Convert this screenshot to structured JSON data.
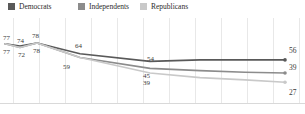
{
  "legend": {
    "items": [
      {
        "label": "Democrats",
        "color": "#595959",
        "x": 8
      },
      {
        "label": "Independents",
        "color": "#8c8c8c",
        "x": 78
      },
      {
        "label": "Republicans",
        "color": "#c9c9c9",
        "x": 140
      }
    ]
  },
  "axis": {
    "baseline_color": "#d9d9d9",
    "gridline_color": "#e8e8e8",
    "gridline_x": [
      13,
      39,
      65,
      91,
      117,
      143,
      169,
      195,
      221,
      247,
      273,
      299
    ]
  },
  "chart_data": {
    "type": "line",
    "title": "",
    "xlabel": "",
    "ylabel": "",
    "grid": true,
    "legend_position": "top-left",
    "ylim": [
      0,
      100
    ],
    "categories": [
      "1",
      "2",
      "3",
      "4",
      "5",
      "6",
      "7",
      "8"
    ],
    "series": [
      {
        "name": "Democrats",
        "color": "#595959",
        "values": [
          77,
          74,
          78,
          64,
          54,
          56,
          56,
          56
        ],
        "end_value": 56
      },
      {
        "name": "Independents",
        "color": "#8c8c8c",
        "values": [
          77,
          72,
          78,
          59,
          45,
          42,
          40,
          39
        ],
        "end_value": 39
      },
      {
        "name": "Republicans",
        "color": "#c9c9c9",
        "values": [
          77,
          72,
          78,
          59,
          39,
          33,
          30,
          27
        ],
        "end_value": 27
      }
    ],
    "point_labels": [
      {
        "text": "77",
        "x": 3,
        "y": 16,
        "series": "Democrats"
      },
      {
        "text": "74",
        "x": 17,
        "y": 19,
        "series": "Democrats"
      },
      {
        "text": "78",
        "x": 32,
        "y": 14,
        "series": "Democrats"
      },
      {
        "text": "77",
        "x": 3,
        "y": 30,
        "series": "Independents"
      },
      {
        "text": "72",
        "x": 18,
        "y": 33,
        "series": "Independents"
      },
      {
        "text": "78",
        "x": 33,
        "y": 29,
        "series": "Independents"
      },
      {
        "text": "64",
        "x": 75,
        "y": 24,
        "series": "Democrats"
      },
      {
        "text": "59",
        "x": 63,
        "y": 45,
        "series": "Independents"
      },
      {
        "text": "54",
        "x": 147,
        "y": 37,
        "series": "Democrats"
      },
      {
        "text": "45",
        "x": 143,
        "y": 54,
        "series": "Independents"
      },
      {
        "text": "39",
        "x": 143,
        "y": 61,
        "series": "Republicans"
      }
    ],
    "end_labels": [
      {
        "text": "56",
        "x": 289,
        "y": 28,
        "series": "Democrats"
      },
      {
        "text": "39",
        "x": 289,
        "y": 45,
        "series": "Independents"
      },
      {
        "text": "27",
        "x": 289,
        "y": 70,
        "series": "Republicans"
      }
    ]
  }
}
